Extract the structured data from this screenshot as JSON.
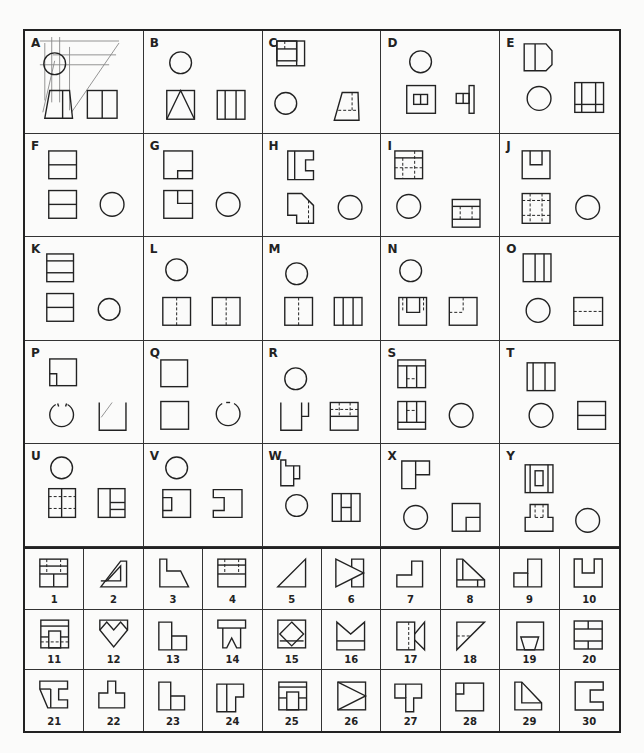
{
  "worksheet": {
    "problems": [
      {
        "letter": "A"
      },
      {
        "letter": "B"
      },
      {
        "letter": "C"
      },
      {
        "letter": "D"
      },
      {
        "letter": "E"
      },
      {
        "letter": "F"
      },
      {
        "letter": "G"
      },
      {
        "letter": "H"
      },
      {
        "letter": "I"
      },
      {
        "letter": "J"
      },
      {
        "letter": "K"
      },
      {
        "letter": "L"
      },
      {
        "letter": "M"
      },
      {
        "letter": "N"
      },
      {
        "letter": "O"
      },
      {
        "letter": "P"
      },
      {
        "letter": "Q"
      },
      {
        "letter": "R"
      },
      {
        "letter": "S"
      },
      {
        "letter": "T"
      },
      {
        "letter": "U"
      },
      {
        "letter": "V"
      },
      {
        "letter": "W"
      },
      {
        "letter": "X"
      },
      {
        "letter": "Y"
      }
    ],
    "answer_choices": [
      {
        "number": "1"
      },
      {
        "number": "2"
      },
      {
        "number": "3"
      },
      {
        "number": "4"
      },
      {
        "number": "5"
      },
      {
        "number": "6"
      },
      {
        "number": "7"
      },
      {
        "number": "8"
      },
      {
        "number": "9"
      },
      {
        "number": "10"
      },
      {
        "number": "11"
      },
      {
        "number": "12"
      },
      {
        "number": "13"
      },
      {
        "number": "14"
      },
      {
        "number": "15"
      },
      {
        "number": "16"
      },
      {
        "number": "17"
      },
      {
        "number": "18"
      },
      {
        "number": "19"
      },
      {
        "number": "20"
      },
      {
        "number": "21"
      },
      {
        "number": "22"
      },
      {
        "number": "23"
      },
      {
        "number": "24"
      },
      {
        "number": "25"
      },
      {
        "number": "26"
      },
      {
        "number": "27"
      },
      {
        "number": "28"
      },
      {
        "number": "29"
      },
      {
        "number": "30"
      }
    ]
  }
}
